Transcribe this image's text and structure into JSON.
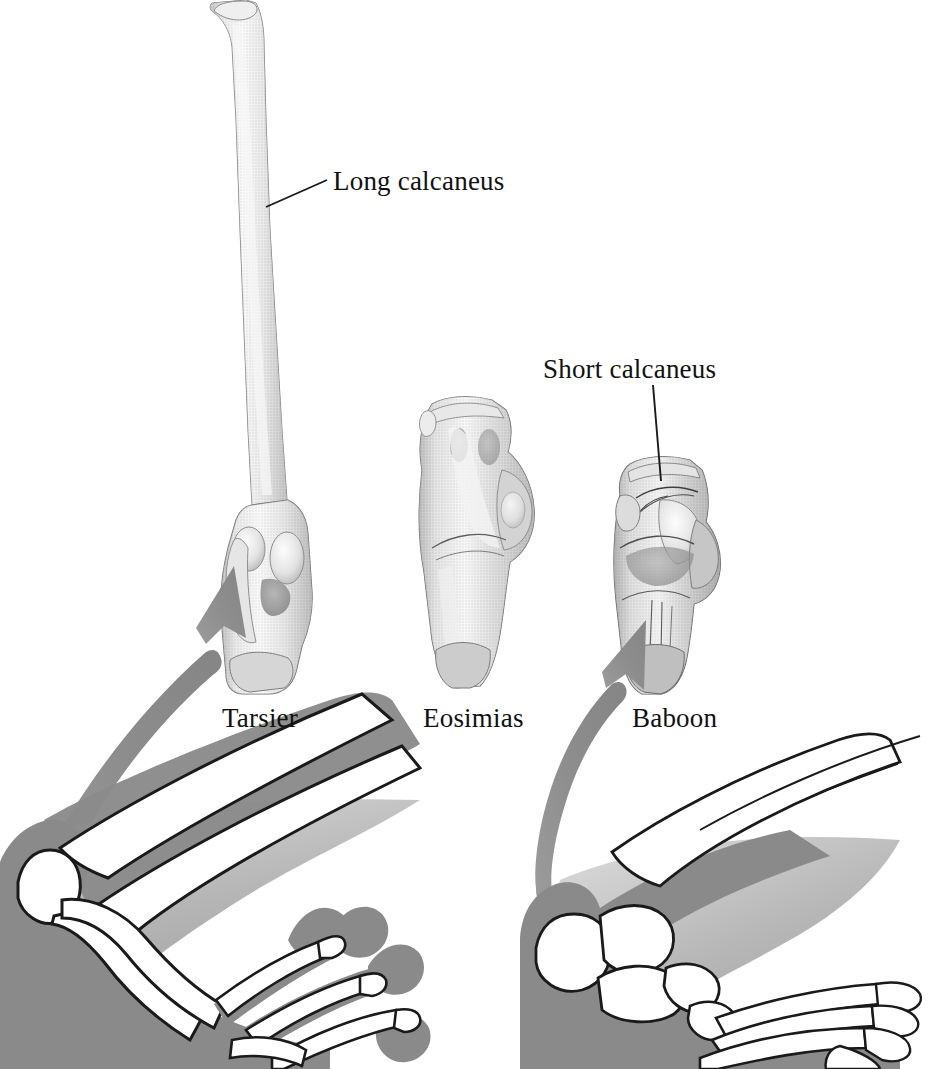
{
  "figure": {
    "background_color": "#ffffff",
    "width": 942,
    "height": 1069
  },
  "callouts": [
    {
      "id": "long-calcaneus",
      "text": "Long calcaneus",
      "x": 333,
      "y": 166,
      "leader": {
        "x1": 327,
        "y1": 180,
        "x2": 266,
        "y2": 207
      }
    },
    {
      "id": "short-calcaneus",
      "text": "Short calcaneus",
      "x": 543,
      "y": 354,
      "leader": {
        "x1": 653,
        "y1": 385,
        "x2": 661,
        "y2": 480
      }
    }
  ],
  "specimens": [
    {
      "id": "tarsier",
      "label": "Tarsier",
      "label_x": 222,
      "label_y": 703,
      "calcaneus": "long",
      "bone_color": "#bdbdbd"
    },
    {
      "id": "eosimias",
      "label": "Eosimias",
      "label_x": 423,
      "label_y": 703,
      "calcaneus": "intermediate",
      "bone_color": "#b5b5b5"
    },
    {
      "id": "baboon",
      "label": "Baboon",
      "label_x": 632,
      "label_y": 703,
      "calcaneus": "short",
      "bone_color": "#a8a8a8"
    }
  ],
  "arrows": [
    {
      "id": "tarsier-arrow",
      "from": "tarsier-foot-heel",
      "to": "tarsier-calcaneus",
      "color": "#8d8d8d"
    },
    {
      "id": "baboon-arrow",
      "from": "baboon-foot-heel",
      "to": "baboon-calcaneus",
      "color": "#8d8d8d"
    }
  ],
  "foot_diagrams": [
    {
      "id": "tarsier-foot",
      "species": "Tarsier",
      "posture": "elongated tarsus, grasping toes with expanded toe pads",
      "soft_tissue_color": "#8a8a8a",
      "bone_fill": "#ffffff",
      "outline_color": "#1a1a1a"
    },
    {
      "id": "baboon-foot",
      "species": "Baboon",
      "posture": "plantigrade foot with short heel",
      "soft_tissue_color": "#8a8a8a",
      "bone_fill": "#ffffff",
      "outline_color": "#1a1a1a"
    }
  ],
  "colors": {
    "text": "#111111",
    "arrow_gray": "#8d8d8d",
    "soft_tissue_gray": "#8a8a8a",
    "shadow_gray": "#b9b9b9",
    "bone_outline": "#1a1a1a",
    "bone_white": "#ffffff"
  }
}
